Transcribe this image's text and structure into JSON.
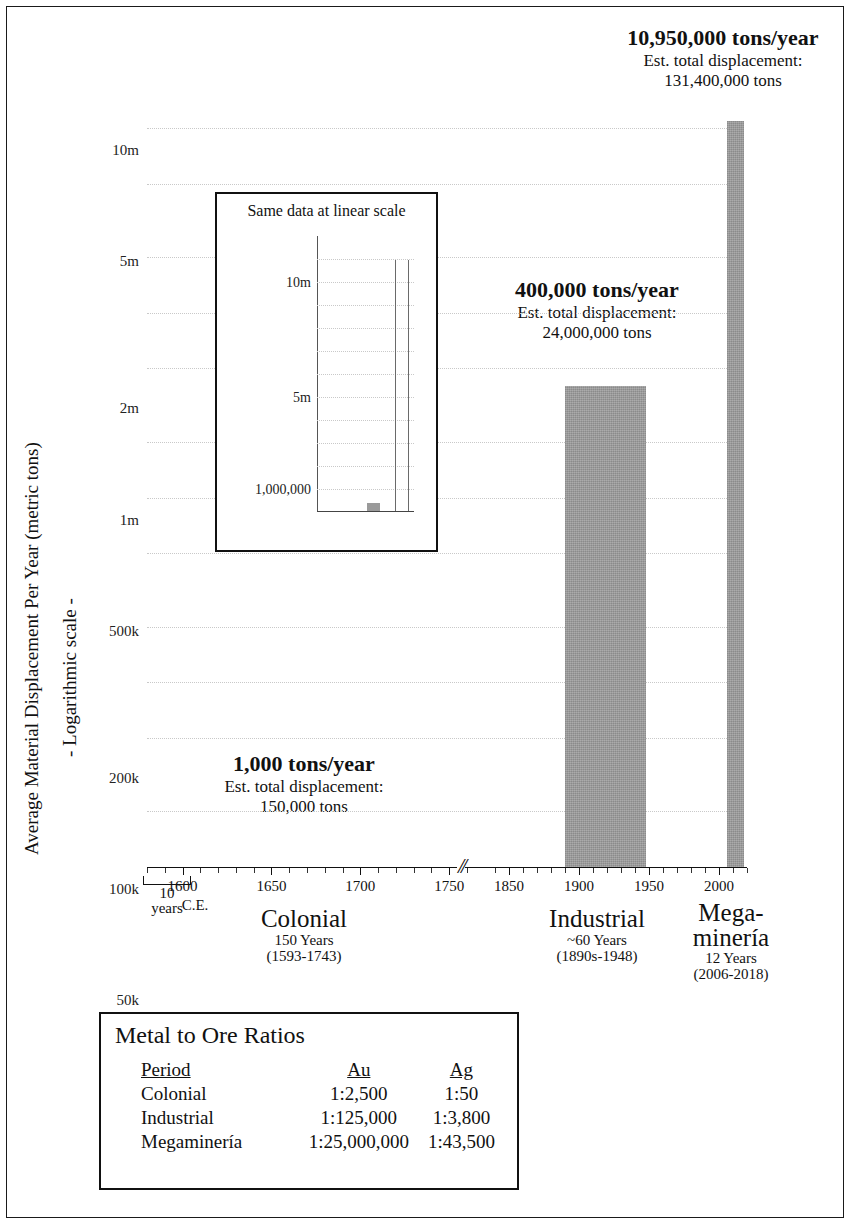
{
  "chart_data": {
    "type": "bar",
    "title": "",
    "ylabel": "Average Material Displacement Per Year (metric tons)",
    "ylabel2": "- Logarithmic scale -",
    "xlabel": "",
    "scale": "log",
    "grid": true,
    "ylim": [
      1000,
      13000000
    ],
    "yticks": [
      "10m",
      "5m",
      "2m",
      "1m",
      "500k",
      "200k",
      "100k",
      "50k",
      "20k",
      "10k",
      "5k",
      "2k",
      "1,000"
    ],
    "ytick_values": [
      10000000,
      5000000,
      2000000,
      1000000,
      500000,
      200000,
      100000,
      50000,
      20000,
      10000,
      5000,
      2000,
      1000
    ],
    "xtick_labels": [
      "1600",
      "1650",
      "1700",
      "1750",
      "1850",
      "1900",
      "1950",
      "2000"
    ],
    "xtick_values": [
      1600,
      1650,
      1700,
      1750,
      1850,
      1900,
      1950,
      2000
    ],
    "x_axis_note": "C.E.",
    "x_axis_break": "//",
    "x_scale_indicator": {
      "value": "10",
      "unit": "years"
    },
    "categories": [
      "Colonial",
      "Industrial",
      "Megaminería"
    ],
    "values": [
      1000,
      400000,
      10950000
    ],
    "value_labels": [
      "1,000 tons/year",
      "400,000 tons/year",
      "10,950,000 tons/year"
    ],
    "totals": [
      "150,000 tons",
      "24,000,000 tons",
      "131,400,000 tons"
    ],
    "total_prefix": "Est. total displacement:",
    "spans": [
      {
        "name": "Colonial",
        "start": 1593,
        "end": 1743
      },
      {
        "name": "Industrial",
        "start": 1890,
        "end": 1948
      },
      {
        "name": "Megaminería",
        "start": 2006,
        "end": 2018
      }
    ],
    "bar_color": "#9a9a9a"
  },
  "annotations": [
    {
      "big": "1,000 tons/year",
      "line2": "Est. total displacement:",
      "line3": "150,000 tons"
    },
    {
      "big": "400,000 tons/year",
      "line2": "Est. total displacement:",
      "line3": "24,000,000 tons"
    },
    {
      "big": "10,950,000 tons/year",
      "line2": "Est. total displacement:",
      "line3": "131,400,000 tons"
    }
  ],
  "periods": [
    {
      "name": "Colonial",
      "name2": "",
      "duration": "150 Years",
      "range": "(1593-1743)"
    },
    {
      "name": "Industrial",
      "name2": "",
      "duration": "~60 Years",
      "range": "(1890s-1948)"
    },
    {
      "name": "Mega-",
      "name2": "minería",
      "duration": "12 Years",
      "range": "(2006-2018)"
    }
  ],
  "axis": {
    "y_title": "Average Material Displacement Per Year (metric tons)",
    "y_title2": "- Logarithmic scale -",
    "y_ticks": [
      "10m",
      "5m",
      "2m",
      "1m",
      "500k",
      "200k",
      "100k",
      "50k",
      "20k",
      "10k",
      "5k",
      "2k",
      "1,000"
    ],
    "x_ticks": [
      "1600",
      "1650",
      "1700",
      "1750",
      "1850",
      "1900",
      "1950",
      "2000"
    ],
    "ce_label": "C.E.",
    "break_glyph": "//",
    "scale_value": "10",
    "scale_unit": "years"
  },
  "inset": {
    "title": "Same data at linear scale",
    "chart_data": {
      "type": "bar",
      "scale": "linear",
      "title": "Same data at linear scale",
      "categories": [
        "Colonial",
        "Industrial",
        "Megaminería"
      ],
      "values": [
        1000,
        400000,
        10950000
      ],
      "ylim": [
        0,
        12000000
      ],
      "yticks": [
        "10m",
        "5m",
        "1,000,000"
      ],
      "ytick_values": [
        10000000,
        5000000,
        1000000
      ],
      "grid": true
    },
    "yticks": [
      "10m",
      "5m",
      "1,000,000"
    ]
  },
  "ratios": {
    "title": "Metal to Ore Ratios",
    "columns": [
      "Period",
      "Au",
      "Ag"
    ],
    "rows": [
      {
        "period": "Colonial",
        "au": "1:2,500",
        "ag": "1:50"
      },
      {
        "period": "Industrial",
        "au": "1:125,000",
        "ag": "1:3,800"
      },
      {
        "period": "Megaminería",
        "au": "1:25,000,000",
        "ag": "1:43,500"
      }
    ]
  }
}
